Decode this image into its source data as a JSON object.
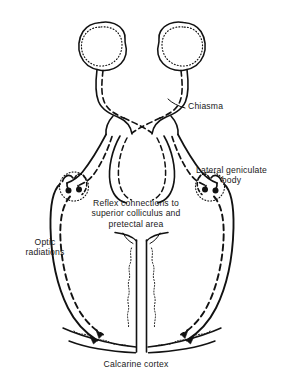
{
  "figure": {
    "background_color": "#ffffff",
    "ink_color": "#121212"
  },
  "labels": {
    "chiasma": "Chiasma",
    "lateral_geniculate_body_line1": "Lateral geniculate",
    "lateral_geniculate_body_line2": "body",
    "reflex_line1": "Reflex connections to",
    "reflex_line2": "superior colliculus and",
    "reflex_line3": "pretectal area",
    "optic_radiations_line1": "Optic",
    "optic_radiations_line2": "radiations",
    "calcarine_cortex": "Calcarine cortex"
  },
  "structures": {
    "eyes": [
      {
        "side": "left",
        "name": "left-eye-globe",
        "retina_style": "dotted"
      },
      {
        "side": "right",
        "name": "right-eye-globe",
        "retina_style": "dotted"
      }
    ],
    "pathway_styles": {
      "temporal_fibers": "solid",
      "nasal_fibers": "dashed"
    },
    "geniculate_bodies": [
      {
        "side": "left",
        "synapse_dots": 2
      },
      {
        "side": "right",
        "synapse_dots": 2
      }
    ],
    "cortex": {
      "name": "calcarine-cortex",
      "feature": "wavy cortical folds with arrowheads"
    }
  }
}
